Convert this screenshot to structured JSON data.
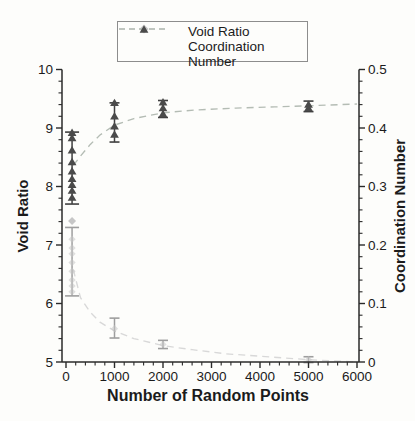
{
  "colors": {
    "axis": "#2a2a2a",
    "text": "#1b1b1b",
    "legend_border": "#8d8d8d",
    "void_ratio_marker": "#c6c6c6",
    "void_ratio_error": "#9e9e9e",
    "void_ratio_line": "#d8d8d8",
    "coordination_marker": "#4a4a4a",
    "coordination_error": "#3f3f3f",
    "coordination_line": "#b4bcb4"
  },
  "legend": {
    "items": [
      {
        "label": "Void Ratio",
        "marker": "diamond"
      },
      {
        "label": "Coordination Number",
        "marker": "triangle"
      }
    ]
  },
  "chart_data": {
    "type": "scatter",
    "title": "",
    "xlabel": "Number of Random Points",
    "ylabel_left": "Void Ratio",
    "ylabel_right": "Coordination Number",
    "grid": false,
    "legend_position": "top-center",
    "x_axis": {
      "min": 0,
      "max": 6000,
      "major_ticks": [
        0,
        1000,
        2000,
        3000,
        4000,
        5000,
        6000
      ],
      "minor_step": 200
    },
    "y_left": {
      "min": 5,
      "max": 10,
      "major_ticks": [
        5,
        6,
        7,
        8,
        9,
        10
      ],
      "minor_step": 0.2
    },
    "y_right": {
      "min": 0,
      "max": 0.5,
      "major_ticks": [
        0,
        0.1,
        0.2,
        0.3,
        0.4,
        0.5
      ],
      "minor_step": 0.02
    },
    "series": [
      {
        "name": "Void Ratio",
        "axis": "left",
        "marker": "diamond",
        "points": [
          {
            "x": 125,
            "values": [
              7.41
            ],
            "values_faint": [
              7.1,
              6.95,
              6.85,
              6.7,
              6.55,
              6.4,
              6.3,
              6.2
            ],
            "error_low": 6.13,
            "error_high": 7.3,
            "cap": 14
          },
          {
            "x": 1000,
            "values": [],
            "values_faint": [
              5.57
            ],
            "error_low": 5.41,
            "error_high": 5.75,
            "cap": 10
          },
          {
            "x": 2000,
            "values": [],
            "values_faint": [
              5.3
            ],
            "error_low": 5.23,
            "error_high": 5.37,
            "cap": 10
          },
          {
            "x": 5000,
            "values": [],
            "values_faint": [
              5.04
            ],
            "error_low": 4.99,
            "error_high": 5.09,
            "cap": 10
          }
        ],
        "trend_line": [
          [
            150,
            6.58
          ],
          [
            300,
            6.1
          ],
          [
            500,
            5.85
          ],
          [
            700,
            5.68
          ],
          [
            1000,
            5.53
          ],
          [
            1400,
            5.4
          ],
          [
            2000,
            5.28
          ],
          [
            2600,
            5.21
          ],
          [
            3300,
            5.14
          ],
          [
            4000,
            5.1
          ],
          [
            5000,
            5.04
          ],
          [
            6000,
            5.0
          ]
        ]
      },
      {
        "name": "Coordination Number",
        "axis": "right",
        "marker": "triangle",
        "points": [
          {
            "x": 125,
            "values": [
              0.392,
              0.383,
              0.362,
              0.342,
              0.326,
              0.313,
              0.303,
              0.293,
              0.281
            ],
            "error_low": 0.27,
            "error_high": 0.393,
            "cap": 14
          },
          {
            "x": 1000,
            "values": [
              0.443,
              0.42,
              0.403,
              0.389
            ],
            "error_low": 0.376,
            "error_high": 0.443,
            "cap": 10
          },
          {
            "x": 2000,
            "values": [
              0.444,
              0.434,
              0.424
            ],
            "error_low": 0.418,
            "error_high": 0.447,
            "cap": 10
          },
          {
            "x": 5000,
            "values": [
              0.44,
              0.434
            ],
            "error_low": 0.428,
            "error_high": 0.446,
            "cap": 10
          }
        ],
        "trend_line": [
          [
            150,
            0.336
          ],
          [
            300,
            0.352
          ],
          [
            500,
            0.372
          ],
          [
            700,
            0.388
          ],
          [
            1000,
            0.405
          ],
          [
            1400,
            0.416
          ],
          [
            2000,
            0.426
          ],
          [
            2700,
            0.431
          ],
          [
            3500,
            0.434
          ],
          [
            4300,
            0.436
          ],
          [
            5000,
            0.438
          ],
          [
            6000,
            0.441
          ]
        ]
      }
    ]
  }
}
